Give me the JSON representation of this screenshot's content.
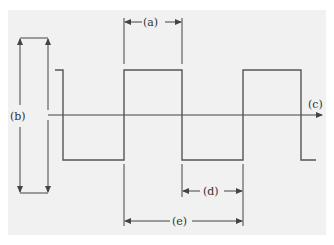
{
  "diagram": {
    "type": "square-wave",
    "background_color": "#f1f1f1",
    "line_color": "#555555",
    "labels": {
      "a": "(a)",
      "b": "(b)",
      "c": "(c)",
      "d": "(d)",
      "e": "(e)"
    },
    "annotations": [
      {
        "id": "a",
        "meaning": "pulse width (high time)"
      },
      {
        "id": "b",
        "meaning": "peak-to-peak amplitude"
      },
      {
        "id": "c",
        "meaning": "time axis"
      },
      {
        "id": "d",
        "meaning": "low time"
      },
      {
        "id": "e",
        "meaning": "period"
      }
    ]
  }
}
